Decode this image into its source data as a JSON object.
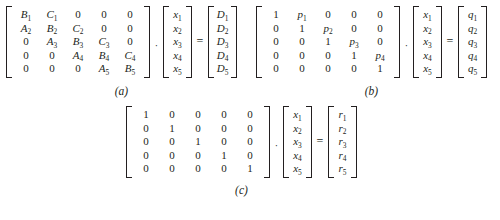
{
  "figure": {
    "background_color": "#ffffff",
    "text_color": "#231f20",
    "operators": {
      "multiply": "·",
      "equals": "="
    }
  },
  "equations": [
    {
      "id": "a",
      "caption": "(a)",
      "description": "tridiagonal coefficient matrix times unknown vector equals right-hand-side vector",
      "matrix": {
        "name": "tridiagonal-matrix",
        "rows": 5,
        "cols": 5,
        "cells": [
          [
            "B₁",
            "C₁",
            "0",
            "0",
            "0"
          ],
          [
            "A₂",
            "B₂",
            "C₂",
            "0",
            "0"
          ],
          [
            "0",
            "A₃",
            "B₃",
            "C₃",
            "0"
          ],
          [
            "0",
            "0",
            "A₄",
            "B₄",
            "C₄"
          ],
          [
            "0",
            "0",
            "0",
            "A₅",
            "B₅"
          ]
        ],
        "plain_cells": [
          [
            false,
            false,
            true,
            true,
            true
          ],
          [
            false,
            false,
            false,
            true,
            true
          ],
          [
            true,
            false,
            false,
            false,
            true
          ],
          [
            true,
            true,
            false,
            false,
            false
          ],
          [
            true,
            true,
            true,
            false,
            false
          ]
        ]
      },
      "unknown_vector": {
        "name": "x-vector",
        "cells": [
          "x₁",
          "x₂",
          "x₃",
          "x₄",
          "x₅"
        ]
      },
      "result_vector": {
        "name": "D-vector",
        "cells": [
          "D₁",
          "D₂",
          "D₃",
          "D₄",
          "D₅"
        ]
      }
    },
    {
      "id": "b",
      "caption": "(b)",
      "description": "upper bidiagonal matrix with unit diagonal times unknown vector equals q vector",
      "matrix": {
        "name": "upper-bidiagonal-matrix",
        "rows": 5,
        "cols": 5,
        "cells": [
          [
            "1",
            "p₁",
            "0",
            "0",
            "0"
          ],
          [
            "0",
            "1",
            "p₂",
            "0",
            "0"
          ],
          [
            "0",
            "0",
            "1",
            "p₃",
            "0"
          ],
          [
            "0",
            "0",
            "0",
            "1",
            "p₄"
          ],
          [
            "0",
            "0",
            "0",
            "0",
            "1"
          ]
        ],
        "plain_cells": [
          [
            true,
            false,
            true,
            true,
            true
          ],
          [
            true,
            true,
            false,
            true,
            true
          ],
          [
            true,
            true,
            true,
            false,
            true
          ],
          [
            true,
            true,
            true,
            true,
            false
          ],
          [
            true,
            true,
            true,
            true,
            true
          ]
        ]
      },
      "unknown_vector": {
        "name": "x-vector",
        "cells": [
          "x₁",
          "x₂",
          "x₃",
          "x₄",
          "x₅"
        ]
      },
      "result_vector": {
        "name": "q-vector",
        "cells": [
          "q₁",
          "q₂",
          "q₃",
          "q₄",
          "q₅"
        ]
      }
    },
    {
      "id": "c",
      "caption": "(c)",
      "description": "identity matrix times unknown vector equals solution vector",
      "matrix": {
        "name": "identity-matrix",
        "rows": 5,
        "cols": 5,
        "cells": [
          [
            "1",
            "0",
            "0",
            "0",
            "0"
          ],
          [
            "0",
            "1",
            "0",
            "0",
            "0"
          ],
          [
            "0",
            "0",
            "1",
            "0",
            "0"
          ],
          [
            "0",
            "0",
            "0",
            "1",
            "0"
          ],
          [
            "0",
            "0",
            "0",
            "0",
            "1"
          ]
        ],
        "plain_cells": [
          [
            true,
            true,
            true,
            true,
            true
          ],
          [
            true,
            true,
            true,
            true,
            true
          ],
          [
            true,
            true,
            true,
            true,
            true
          ],
          [
            true,
            true,
            true,
            true,
            true
          ],
          [
            true,
            true,
            true,
            true,
            true
          ]
        ]
      },
      "unknown_vector": {
        "name": "x-vector",
        "cells": [
          "x₁",
          "x₂",
          "x₃",
          "x₄",
          "x₅"
        ]
      },
      "result_vector": {
        "name": "r-vector",
        "cells": [
          "r₁",
          "r₂",
          "r₃",
          "r₄",
          "r₅"
        ]
      }
    }
  ]
}
